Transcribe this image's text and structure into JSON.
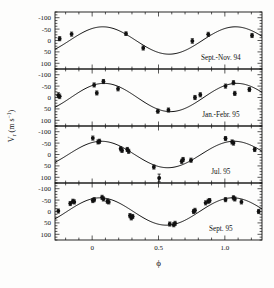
{
  "figure": {
    "name": "radial-velocity-phase-curves",
    "background": "#fdfdfc",
    "ink": "#111111",
    "width": 274,
    "height": 288
  },
  "axes": {
    "xlabel": "ϕ",
    "ylabel_main": "V",
    "ylabel_sub": "r",
    "ylabel_units": "(m s",
    "ylabel_exp": "−1",
    "ylabel_close": ")",
    "ylabel_full": "V_r (m s⁻¹)",
    "xticks": [
      0,
      0.5,
      1.0
    ],
    "xticklabels": [
      "0",
      "0.5",
      "1.0"
    ],
    "yticks": [
      -100,
      -50,
      0,
      50,
      100
    ],
    "yticklabels": [
      "100",
      "50",
      "0",
      "-50",
      "-100"
    ],
    "xlim": [
      -0.28,
      1.28
    ],
    "ylim": [
      -125,
      125
    ],
    "xminor_step": 0.1,
    "yminor_step": 12.5,
    "grid": false,
    "tick_direction": "in"
  },
  "chart_data": {
    "type": "scatter",
    "title": "",
    "xlabel": "ϕ",
    "ylabel": "V_r (m s⁻¹)",
    "xlim": [
      -0.28,
      1.28
    ],
    "ylim": [
      -125,
      125
    ],
    "grid": false,
    "legend": "none",
    "panels": [
      {
        "label": "Sept.-Nov. 94",
        "label_x": 0.97,
        "label_y": -85,
        "fit": {
          "type": "sine",
          "amplitude": 60,
          "phase_offset": 0.08,
          "mean": 0
        },
        "points": [
          {
            "x": -0.245,
            "y": 8,
            "yerr": 9
          },
          {
            "x": -0.155,
            "y": 28,
            "yerr": 9
          },
          {
            "x": 0.255,
            "y": 30,
            "yerr": 8
          },
          {
            "x": 0.385,
            "y": -33,
            "yerr": 9
          },
          {
            "x": 0.755,
            "y": -2,
            "yerr": 10
          },
          {
            "x": 0.875,
            "y": 27,
            "yerr": 9
          },
          {
            "x": 1.205,
            "y": 22,
            "yerr": 9
          }
        ]
      },
      {
        "label": "Jan.-Febr. 95",
        "label_x": 0.97,
        "label_y": -85,
        "fit": {
          "type": "sine",
          "amplitude": 62,
          "phase_offset": 0.09,
          "mean": 0
        },
        "points": [
          {
            "x": -0.255,
            "y": 10,
            "yerr": 11
          },
          {
            "x": -0.245,
            "y": 5,
            "yerr": 10
          },
          {
            "x": 0.015,
            "y": 55,
            "yerr": 9
          },
          {
            "x": 0.035,
            "y": 20,
            "yerr": 9
          },
          {
            "x": 0.085,
            "y": 70,
            "yerr": 9
          },
          {
            "x": 0.195,
            "y": 38,
            "yerr": 9
          },
          {
            "x": 0.495,
            "y": -60,
            "yerr": 9
          },
          {
            "x": 0.575,
            "y": -55,
            "yerr": 9
          },
          {
            "x": 0.775,
            "y": 0,
            "yerr": 9
          },
          {
            "x": 0.815,
            "y": 12,
            "yerr": 9
          },
          {
            "x": 1.005,
            "y": 50,
            "yerr": 9
          },
          {
            "x": 1.065,
            "y": 65,
            "yerr": 9
          },
          {
            "x": 1.075,
            "y": 18,
            "yerr": 9
          },
          {
            "x": 1.185,
            "y": 35,
            "yerr": 9
          }
        ]
      },
      {
        "label": "Jul. 95",
        "label_x": 0.97,
        "label_y": -85,
        "fit": {
          "type": "sine",
          "amplitude": 58,
          "phase_offset": 0.07,
          "mean": 0
        },
        "points": [
          {
            "x": 0.005,
            "y": 72,
            "yerr": 9
          },
          {
            "x": 0.045,
            "y": 55,
            "yerr": 9
          },
          {
            "x": 0.055,
            "y": 58,
            "yerr": 9
          },
          {
            "x": 0.215,
            "y": 25,
            "yerr": 9
          },
          {
            "x": 0.225,
            "y": 18,
            "yerr": 9
          },
          {
            "x": 0.265,
            "y": 22,
            "yerr": 9
          },
          {
            "x": 0.275,
            "y": 14,
            "yerr": 9
          },
          {
            "x": 0.465,
            "y": -55,
            "yerr": 9
          },
          {
            "x": 0.505,
            "y": -103,
            "yerr": 17
          },
          {
            "x": 0.675,
            "y": -30,
            "yerr": 9
          },
          {
            "x": 0.685,
            "y": -22,
            "yerr": 9
          },
          {
            "x": 0.745,
            "y": -25,
            "yerr": 9
          },
          {
            "x": 1.005,
            "y": 70,
            "yerr": 9
          },
          {
            "x": 1.055,
            "y": 55,
            "yerr": 9
          },
          {
            "x": 1.065,
            "y": 50,
            "yerr": 9
          },
          {
            "x": 1.225,
            "y": 22,
            "yerr": 9
          }
        ]
      },
      {
        "label": "Sept. 95",
        "label_x": 0.97,
        "label_y": -85,
        "fit": {
          "type": "sine",
          "amplitude": 60,
          "phase_offset": 0.06,
          "mean": 0
        },
        "points": [
          {
            "x": -0.255,
            "y": 2,
            "yerr": 9
          },
          {
            "x": -0.165,
            "y": 35,
            "yerr": 9
          },
          {
            "x": -0.145,
            "y": 45,
            "yerr": 9
          },
          {
            "x": -0.135,
            "y": 42,
            "yerr": 9
          },
          {
            "x": 0.005,
            "y": 48,
            "yerr": 9
          },
          {
            "x": 0.015,
            "y": 52,
            "yerr": 9
          },
          {
            "x": 0.075,
            "y": 62,
            "yerr": 9
          },
          {
            "x": 0.085,
            "y": 55,
            "yerr": 9
          },
          {
            "x": 0.115,
            "y": 45,
            "yerr": 9
          },
          {
            "x": 0.125,
            "y": 42,
            "yerr": 9
          },
          {
            "x": 0.285,
            "y": -18,
            "yerr": 9
          },
          {
            "x": 0.295,
            "y": -28,
            "yerr": 9
          },
          {
            "x": 0.305,
            "y": -22,
            "yerr": 9
          },
          {
            "x": 0.585,
            "y": -55,
            "yerr": 9
          },
          {
            "x": 0.615,
            "y": -58,
            "yerr": 9
          },
          {
            "x": 0.625,
            "y": -52,
            "yerr": 9
          },
          {
            "x": 0.765,
            "y": 0,
            "yerr": 9
          },
          {
            "x": 0.775,
            "y": 5,
            "yerr": 9
          },
          {
            "x": 0.855,
            "y": 38,
            "yerr": 9
          },
          {
            "x": 0.875,
            "y": 45,
            "yerr": 9
          },
          {
            "x": 0.885,
            "y": 48,
            "yerr": 9
          },
          {
            "x": 1.005,
            "y": 52,
            "yerr": 9
          },
          {
            "x": 1.065,
            "y": 60,
            "yerr": 9
          },
          {
            "x": 1.075,
            "y": 55,
            "yerr": 9
          },
          {
            "x": 1.125,
            "y": 42,
            "yerr": 9
          },
          {
            "x": 1.255,
            "y": 0,
            "yerr": 9
          }
        ]
      }
    ]
  }
}
